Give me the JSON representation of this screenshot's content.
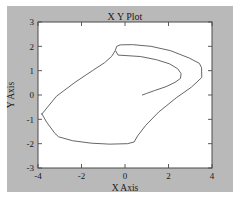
{
  "figure": {
    "background_color": "#b9b9b9",
    "axes_background_color": "#ffffff",
    "frame_color": "#4a4a4a"
  },
  "chart_data": {
    "type": "line",
    "title": "X Y Plot",
    "xlabel": "X Axis",
    "ylabel": "Y Axis",
    "xlim": [
      -4,
      4
    ],
    "ylim": [
      -3,
      3
    ],
    "xticks": [
      -4,
      -2,
      0,
      2,
      4
    ],
    "xtick_labels": [
      "-4",
      "-2",
      "0",
      "2",
      "4"
    ],
    "yticks": [
      -3,
      -2,
      -1,
      0,
      1,
      2,
      3
    ],
    "ytick_labels": [
      "-3",
      "-2",
      "-1",
      "0",
      "1",
      "2",
      "3"
    ],
    "grid": false,
    "legend": null,
    "line_color": "#555555",
    "series": [
      {
        "name": "outer-loop",
        "closed": true,
        "points": [
          [
            -3.82,
            -0.78
          ],
          [
            -3.15,
            -0.05
          ],
          [
            -2.3,
            0.52
          ],
          [
            -1.5,
            1.0
          ],
          [
            -0.95,
            1.32
          ],
          [
            -0.62,
            1.58
          ],
          [
            -0.45,
            1.82
          ],
          [
            -0.38,
            2.0
          ],
          [
            -0.22,
            2.06
          ],
          [
            0.35,
            2.07
          ],
          [
            1.2,
            2.0
          ],
          [
            2.1,
            1.82
          ],
          [
            2.95,
            1.52
          ],
          [
            3.42,
            1.3
          ],
          [
            3.52,
            1.12
          ],
          [
            3.53,
            0.72
          ],
          [
            3.05,
            0.32
          ],
          [
            2.35,
            -0.12
          ],
          [
            1.55,
            -0.7
          ],
          [
            0.95,
            -1.25
          ],
          [
            0.58,
            -1.68
          ],
          [
            0.42,
            -1.93
          ],
          [
            0.12,
            -2.0
          ],
          [
            -0.7,
            -2.02
          ],
          [
            -1.55,
            -1.98
          ],
          [
            -2.4,
            -1.88
          ],
          [
            -3.05,
            -1.72
          ],
          [
            -3.22,
            -1.58
          ],
          [
            -3.6,
            -1.12
          ],
          [
            -3.82,
            -0.78
          ]
        ]
      },
      {
        "name": "inner-fold",
        "closed": false,
        "points": [
          [
            -0.42,
            1.8
          ],
          [
            -0.32,
            1.64
          ],
          [
            0.05,
            1.62
          ],
          [
            0.72,
            1.58
          ],
          [
            1.45,
            1.45
          ],
          [
            2.05,
            1.28
          ],
          [
            2.42,
            1.08
          ],
          [
            2.58,
            0.88
          ],
          [
            2.55,
            0.68
          ],
          [
            2.3,
            0.52
          ],
          [
            1.88,
            0.34
          ],
          [
            1.35,
            0.18
          ],
          [
            0.98,
            0.06
          ],
          [
            0.8,
            0.0
          ]
        ]
      }
    ]
  }
}
